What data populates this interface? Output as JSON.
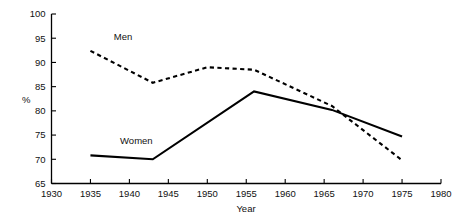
{
  "chart_data": {
    "type": "line",
    "title": "",
    "xlabel": "Year",
    "ylabel": "%",
    "xlim": [
      1930,
      1980
    ],
    "ylim": [
      65,
      100
    ],
    "xticks": [
      1930,
      1935,
      1940,
      1945,
      1950,
      1955,
      1960,
      1965,
      1970,
      1975,
      1980
    ],
    "yticks": [
      65,
      70,
      75,
      80,
      85,
      90,
      95,
      100
    ],
    "grid": false,
    "legend_position": "inline-labels",
    "series": [
      {
        "name": "Men",
        "style": "dashed",
        "x": [
          1935,
          1943,
          1950,
          1956,
          1966,
          1975
        ],
        "values": [
          92.4,
          85.8,
          89.0,
          88.5,
          81.0,
          69.8
        ]
      },
      {
        "name": "Women",
        "style": "solid",
        "x": [
          1935,
          1943,
          1956,
          1966,
          1975
        ],
        "values": [
          70.8,
          70.0,
          84.0,
          80.2,
          74.7
        ]
      }
    ],
    "annotations": [
      {
        "text": "Men",
        "x": 1938.0,
        "y": 94.6
      },
      {
        "text": "Women",
        "x": 1938.8,
        "y": 73.2
      }
    ]
  },
  "axis": {
    "y_title": "%",
    "x_title": "Year",
    "x_tick_labels": [
      "1930",
      "1935",
      "1940",
      "1945",
      "1950",
      "1955",
      "1960",
      "1965",
      "1970",
      "1975",
      "1980"
    ],
    "y_tick_labels": [
      "65",
      "70",
      "75",
      "80",
      "85",
      "90",
      "95",
      "100"
    ]
  },
  "colors": {
    "axis": "#000000",
    "series_men": "#000000",
    "series_women": "#000000",
    "background": "#ffffff"
  }
}
